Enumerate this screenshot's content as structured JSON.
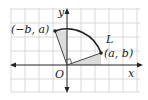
{
  "diagram": {
    "axes": {
      "x_label": "x",
      "y_label": "y",
      "origin_label": "O"
    },
    "points": [
      {
        "name": "P",
        "label": "(a, b)",
        "description": "original point"
      },
      {
        "name": "P_rot",
        "label": "(−b, a)",
        "description": "image after 90° counterclockwise rotation"
      }
    ],
    "arc_label": "L",
    "colors": {
      "grid": "#d0d0d0",
      "axis": "#222222",
      "arc": "#222222",
      "shade": "#dcdcdc",
      "segment": "#444444"
    },
    "annotations": [
      "right-angle marker at origin between the two radii"
    ]
  }
}
